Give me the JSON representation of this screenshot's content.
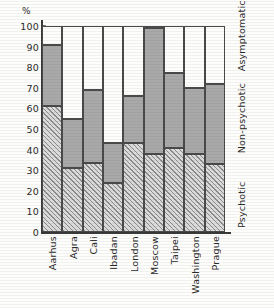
{
  "chart_data": {
    "type": "bar",
    "subtype": "stacked-bar-100",
    "title": "",
    "xlabel": "",
    "ylabel": "%",
    "ylim": [
      0,
      100
    ],
    "yticks": [
      0,
      10,
      20,
      30,
      40,
      50,
      60,
      70,
      80,
      90,
      100
    ],
    "ytick_labels": [
      "0",
      "10",
      "20",
      "30",
      "40",
      "50",
      "60",
      "70",
      "80",
      "90",
      "100"
    ],
    "grid": false,
    "legend_position": "right-axis-labels",
    "categories": [
      "Aarhus",
      "Agra",
      "Cali",
      "Ibadan",
      "London",
      "Moscow",
      "Taipei",
      "Washington",
      "Prague"
    ],
    "series": [
      {
        "name": "Psychotic",
        "values": [
          61,
          31,
          33.5,
          24,
          43,
          38,
          41,
          38,
          33
        ]
      },
      {
        "name": "Non-psychotic",
        "values": [
          30,
          24,
          35.5,
          19,
          23,
          61,
          36,
          32,
          39
        ]
      },
      {
        "name": "Asymptomatic",
        "values": [
          9,
          45,
          31,
          57,
          34,
          1,
          23,
          30,
          28
        ]
      }
    ],
    "cumulative_tops": {
      "psychotic": [
        61,
        31,
        33.5,
        24,
        43,
        38,
        41,
        38,
        33
      ],
      "non_psychotic": [
        91,
        55,
        69,
        43,
        66,
        99,
        77,
        70,
        72
      ],
      "asymptomatic": [
        100,
        100,
        100,
        100,
        100,
        100,
        100,
        100,
        100
      ]
    },
    "annotations": [
      "Asymptomatic",
      "Non-psychotic",
      "Psychotic"
    ]
  },
  "axis": {
    "unit_label": "%",
    "y_ticks": [
      "100",
      "90",
      "80",
      "70",
      "60",
      "50",
      "40",
      "30",
      "20",
      "10",
      "0"
    ]
  },
  "category_labels": {
    "asymptomatic": "Asymptomatic",
    "non_psychotic": "Non-psychotic",
    "psychotic": "Psychotic"
  },
  "colors": {
    "axis": "#3a3a3a",
    "psychotic_fill": "#dcdcdc",
    "psychotic_hatch": "#8d8d8d",
    "non_psychotic_fill": "#a9a9a9",
    "asymptomatic_fill": "#fdfdfb",
    "background": "#fdfdfb"
  }
}
